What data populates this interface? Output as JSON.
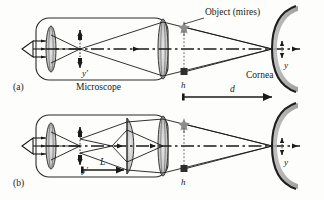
{
  "figure": {
    "title_hidden": "",
    "background_color": "#fdfdfc",
    "ink_color": "#1a1a1a",
    "glass_color": "#c9c9c9",
    "accent_gray": "#9a9a9a"
  },
  "panels": [
    {
      "id": "a",
      "tag": "(a)",
      "labels": {
        "object": "Object (mires)",
        "cornea": "Cornea",
        "microscope": "Microscope",
        "image_height": "y′",
        "object_height": "y",
        "mire_height": "h",
        "distance": "d"
      }
    },
    {
      "id": "b",
      "tag": "(b)",
      "labels": {
        "image_height": "y′",
        "object_height": "y",
        "mire_height": "h",
        "lens_separation": "L"
      }
    }
  ],
  "icons": {
    "eye": "eye-symbol",
    "star": "star-marker",
    "square": "square-marker",
    "arrow": "arrow-marker"
  }
}
